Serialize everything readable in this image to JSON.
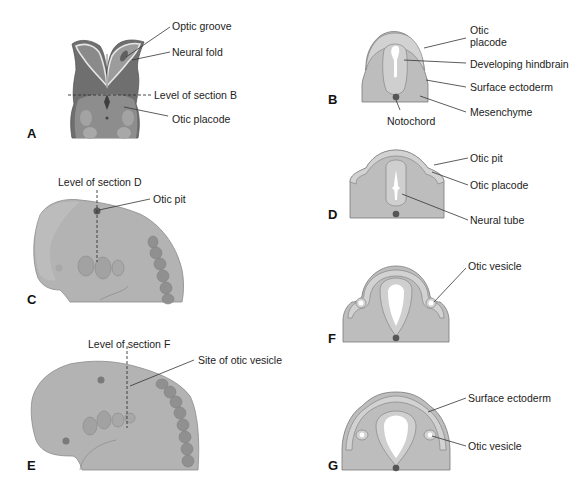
{
  "figure": {
    "colors": {
      "tissue": "#bdbdbd",
      "ectoderm": "#d2d2d2",
      "outline": "#7a7a7a",
      "neural": "#cfcfcf",
      "lumen": "#ffffff",
      "notochord": "#555555",
      "embryo_dark": "#6f6f6f",
      "embryo_mid": "#9a9a9a",
      "embryo_light": "#b5b5b5"
    },
    "panels": {
      "A": {
        "label": "A",
        "labels": {
          "optic_groove": "Optic groove",
          "neural_fold": "Neural fold",
          "level_b": "Level of section B",
          "otic_placode": "Otic placode"
        }
      },
      "B": {
        "label": "B",
        "labels": {
          "otic_placode_1": "Otic",
          "otic_placode_2": "placode",
          "developing_hindbrain": "Developing hindbrain",
          "surface_ectoderm": "Surface ectoderm",
          "mesenchyme": "Mesenchyme",
          "notochord": "Notochord"
        }
      },
      "C": {
        "label": "C",
        "labels": {
          "level_d": "Level of section D",
          "otic_pit": "Otic pit"
        }
      },
      "D": {
        "label": "D",
        "labels": {
          "otic_pit": "Otic pit",
          "otic_placode": "Otic placode",
          "neural_tube": "Neural tube"
        }
      },
      "E": {
        "label": "E",
        "labels": {
          "level_f": "Level of section F",
          "site_otic_vesicle": "Site of otic vesicle"
        }
      },
      "F": {
        "label": "F",
        "labels": {
          "otic_vesicle": "Otic vesicle"
        }
      },
      "G": {
        "label": "G",
        "labels": {
          "surface_ectoderm": "Surface ectoderm",
          "otic_vesicle": "Otic vesicle"
        }
      }
    }
  }
}
